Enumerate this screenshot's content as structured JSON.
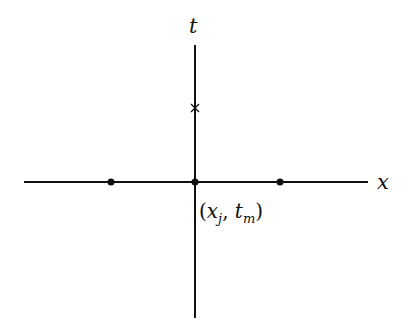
{
  "diagram": {
    "axes": {
      "x_label": "x",
      "t_label": "t"
    },
    "point_label": {
      "open": "(",
      "x": "x",
      "x_sub": "j",
      "comma": ", ",
      "t": "t",
      "t_sub": "m",
      "close": ")"
    },
    "markers": {
      "dots": [
        "left-neighbor",
        "origin",
        "right-neighbor"
      ],
      "cross": "star-marker"
    },
    "colors": {
      "line": "#111111",
      "background": "#ffffff"
    }
  }
}
